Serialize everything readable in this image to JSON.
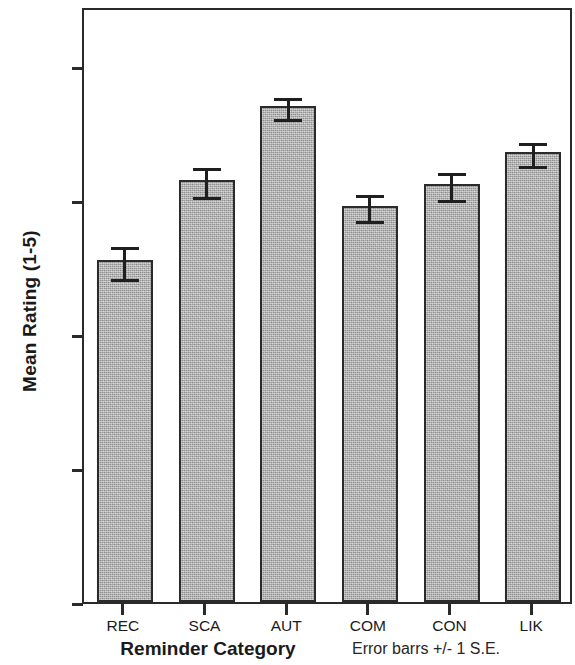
{
  "chart_data": {
    "type": "bar",
    "title": "",
    "subtitle": "",
    "xlabel": "Reminder Category",
    "ylabel": "Mean Rating (1-5)",
    "categories": [
      "REC",
      "SCA",
      "AUT",
      "COM",
      "CON",
      "LIK"
    ],
    "values": [
      2.55,
      3.15,
      3.7,
      2.96,
      3.12,
      3.36
    ],
    "errors": [
      0.13,
      0.12,
      0.09,
      0.11,
      0.11,
      0.1
    ],
    "error_type": "1 S.E.",
    "annotation": "Error barrs +/- 1 S.E.",
    "ylim": [
      0.0,
      4.45
    ],
    "ytick_labels": [
      "0.00",
      "1.00",
      "2.00",
      "3.00",
      "4.00"
    ],
    "ytick_values": [
      0,
      1,
      2,
      3,
      4
    ],
    "grid": false,
    "legend": false,
    "bar_color": "#b9b9b9",
    "bar_edge_color": "#2b2b2b",
    "axis_color": "#2a2a2a",
    "text_color": "#1a1a1a"
  }
}
